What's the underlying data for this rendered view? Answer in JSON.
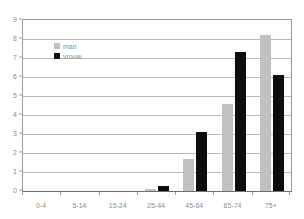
{
  "chart_data": {
    "type": "bar",
    "title": "",
    "subtitle": "",
    "xlabel": "",
    "ylabel": "",
    "categories": [
      "0-4",
      "5-14",
      "15-24",
      "25-44",
      "45-64",
      "65-74",
      "75+"
    ],
    "series": [
      {
        "name": "man",
        "color": "#c0c0c0",
        "values": [
          0,
          0,
          0,
          0.1,
          1.7,
          4.6,
          8.2
        ]
      },
      {
        "name": "vrouw",
        "color": "#0d0d0d",
        "values": [
          0,
          0,
          0,
          0.25,
          3.1,
          7.3,
          6.1
        ]
      }
    ],
    "ylim": [
      0,
      9
    ],
    "yticks": [
      0,
      1,
      2,
      3,
      4,
      5,
      6,
      7,
      8,
      9
    ],
    "ytick_labels": [
      "0",
      "1",
      "2",
      "3",
      "4",
      "5",
      "6",
      "7",
      "8",
      "9"
    ],
    "grid": true,
    "grid_axis": "y",
    "legend_position": "top-left-inside",
    "annotations": []
  },
  "legend": {
    "items": [
      {
        "label": "man",
        "color": "#c0c0c0"
      },
      {
        "label": "vrouw",
        "color": "#0d0d0d"
      }
    ]
  }
}
